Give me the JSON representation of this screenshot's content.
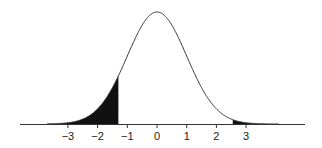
{
  "chart_data": {
    "type": "area",
    "title": "",
    "subtitle": "",
    "xlabel": "",
    "ylabel": "",
    "distribution": {
      "name": "standard normal",
      "mean": 0,
      "sd": 1
    },
    "x_range": [
      -3.7,
      4.1
    ],
    "xlim": [
      -4.6,
      5.0
    ],
    "x_ticks": [
      -3,
      -2,
      -1,
      0,
      1,
      2,
      3
    ],
    "x_tick_labels": [
      "−3",
      "−2",
      "−1",
      "0",
      "1",
      "2",
      "3"
    ],
    "shaded_regions": [
      {
        "name": "left-tail",
        "from": -3.7,
        "to": -1.3,
        "color": "#111111"
      },
      {
        "name": "right-tail",
        "from": 2.55,
        "to": 4.1,
        "color": "#111111"
      }
    ],
    "grid": false,
    "legend": null,
    "colors": {
      "curve": "#333333",
      "fill": "#111111",
      "axis": "#333333"
    }
  }
}
